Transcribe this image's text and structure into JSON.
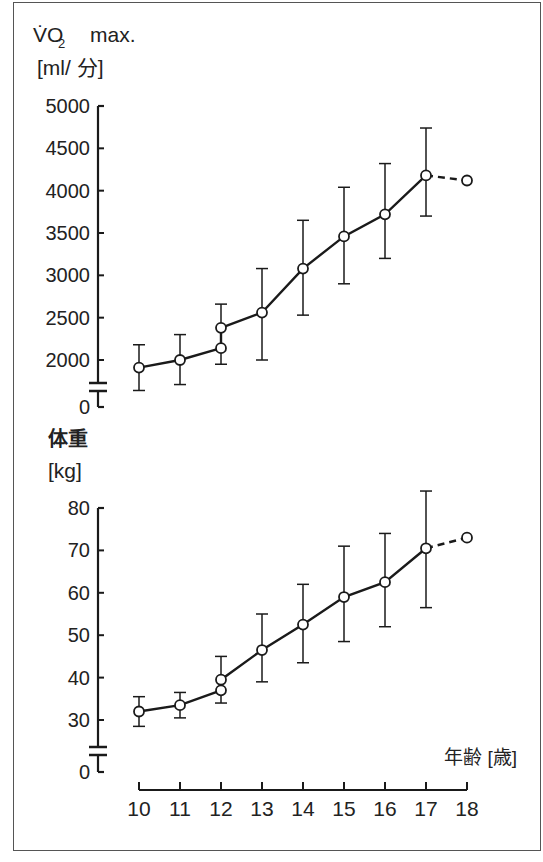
{
  "chart_data": [
    {
      "type": "line",
      "title": "VO2 max.",
      "ylabel_line1": "V̇O2  max.",
      "ylabel_line2": "[ml/ 分]",
      "xlabel": "年齢 [歳]",
      "x": [
        10,
        11,
        12,
        12,
        13,
        14,
        15,
        16,
        17,
        18
      ],
      "series": [
        {
          "name": "VO2 max",
          "points": [
            {
              "x": 10,
              "y": 1910,
              "err_low": 1640,
              "err_high": 2180
            },
            {
              "x": 11,
              "y": 2000,
              "err_low": 1710,
              "err_high": 2300
            },
            {
              "x": 12,
              "y": 2140,
              "err_low": 1950,
              "err_high": null
            },
            {
              "x": 12,
              "y": 2380,
              "err_low": null,
              "err_high": 2660
            },
            {
              "x": 13,
              "y": 2560,
              "err_low": 2000,
              "err_high": 3080
            },
            {
              "x": 14,
              "y": 3080,
              "err_low": 2530,
              "err_high": 3650
            },
            {
              "x": 15,
              "y": 3460,
              "err_low": 2900,
              "err_high": 4040
            },
            {
              "x": 16,
              "y": 3720,
              "err_low": 3200,
              "err_high": 4320
            },
            {
              "x": 17,
              "y": 4180,
              "err_low": 3700,
              "err_high": 4740
            },
            {
              "x": 18,
              "y": 4120,
              "err_low": null,
              "err_high": null,
              "dashed_connector": true
            }
          ]
        }
      ],
      "yticks": [
        "0",
        "2000",
        "2500",
        "3000",
        "3500",
        "4000",
        "4500",
        "5000"
      ],
      "ylim": [
        0,
        5000
      ],
      "axis_break": "between 0 and 2000",
      "grid": false
    },
    {
      "type": "line",
      "title": "体重",
      "ylabel_line1": "体重",
      "ylabel_line2": "[kg]",
      "xlabel": "年齢 [歳]",
      "series": [
        {
          "name": "体重",
          "points": [
            {
              "x": 10,
              "y": 32,
              "err_low": 28.5,
              "err_high": 35.5
            },
            {
              "x": 11,
              "y": 33.5,
              "err_low": 30.5,
              "err_high": 36.5
            },
            {
              "x": 12,
              "y": 37,
              "err_low": 34,
              "err_high": null
            },
            {
              "x": 12,
              "y": 39.5,
              "err_low": null,
              "err_high": 45
            },
            {
              "x": 13,
              "y": 46.5,
              "err_low": 39,
              "err_high": 55
            },
            {
              "x": 14,
              "y": 52.5,
              "err_low": 43.5,
              "err_high": 62
            },
            {
              "x": 15,
              "y": 59,
              "err_low": 48.5,
              "err_high": 71
            },
            {
              "x": 16,
              "y": 62.5,
              "err_low": 52,
              "err_high": 74
            },
            {
              "x": 17,
              "y": 70.5,
              "err_low": 56.5,
              "err_high": 84
            },
            {
              "x": 18,
              "y": 73,
              "err_low": null,
              "err_high": null,
              "dashed_connector": true
            }
          ]
        }
      ],
      "yticks": [
        "0",
        "30",
        "40",
        "50",
        "60",
        "70",
        "80"
      ],
      "ylim": [
        0,
        80
      ],
      "axis_break": "between 0 and 30",
      "grid": false
    }
  ],
  "labels": {
    "top_y1": "V̇O",
    "top_y1_sub": "2",
    "top_y1_rest": "max.",
    "top_y2": "[ml/ 分]",
    "bottom_y1": "体重",
    "bottom_y2": "[kg]",
    "x_axis_title": "年齢 [歳]",
    "top_ticks": [
      "5000",
      "4500",
      "4000",
      "3500",
      "3000",
      "2500",
      "2000",
      "0"
    ],
    "bottom_ticks": [
      "80",
      "70",
      "60",
      "50",
      "40",
      "30",
      "0"
    ],
    "x_ticks": [
      "10",
      "11",
      "12",
      "13",
      "14",
      "15",
      "16",
      "17",
      "18"
    ]
  }
}
